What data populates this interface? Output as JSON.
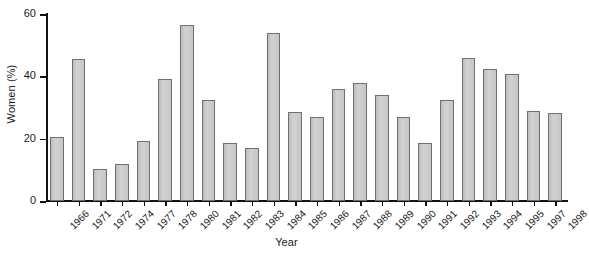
{
  "chart_data": {
    "type": "bar",
    "title": "",
    "xlabel": "Year",
    "ylabel": "Women (%)",
    "categories": [
      "1966",
      "1971",
      "1972",
      "1974",
      "1977",
      "1978",
      "1980",
      "1981",
      "1982",
      "1983",
      "1984",
      "1985",
      "1986",
      "1987",
      "1988",
      "1989",
      "1990",
      "1991",
      "1992",
      "1993",
      "1994",
      "1995",
      "1997",
      "1998"
    ],
    "values": [
      20.7,
      45.5,
      10.4,
      11.8,
      19.2,
      39.0,
      56.5,
      32.5,
      18.5,
      17.0,
      54.0,
      28.5,
      27.0,
      35.8,
      37.8,
      34.0,
      27.0,
      18.7,
      32.5,
      46.0,
      42.5,
      40.6,
      29.0,
      28.2
    ],
    "ylim": [
      0,
      60
    ],
    "yticks": [
      0,
      20,
      40,
      60
    ],
    "ytick_labels": [
      "0",
      "20",
      "40",
      "60"
    ],
    "grid": false,
    "legend": null,
    "bar_color": "#c9c9c9",
    "bar_edge_color": "#6f6f6f",
    "axis_color": "#111111"
  }
}
